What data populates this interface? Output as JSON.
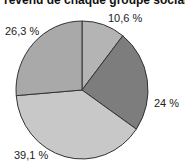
{
  "chart_data": {
    "type": "pie",
    "title": "revenu de chaque groupe social",
    "categories": [
      "Slice 1",
      "Slice 2",
      "Slice 3",
      "Slice 4"
    ],
    "values": [
      10.6,
      24,
      39.1,
      26.3
    ],
    "labels": [
      "10,6 %",
      "24 %",
      "39,1 %",
      "26,3 %"
    ],
    "colors": [
      "#b4b4b4",
      "#7d7d7d",
      "#c8c8c8",
      "#a9a9a9"
    ],
    "start_angle": "top, clockwise",
    "legend": "none"
  }
}
